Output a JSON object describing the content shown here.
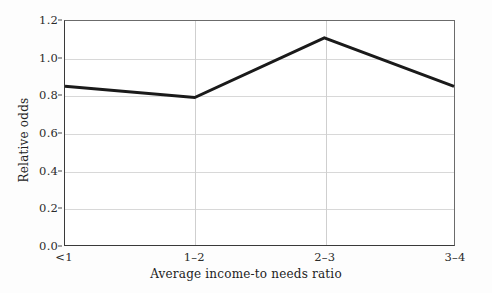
{
  "chart_data": {
    "type": "line",
    "title": "",
    "subtitle": "",
    "xlabel": "Average income-to needs ratio",
    "ylabel": "Relative odds",
    "categories": [
      "<1",
      "1–2",
      "2–3",
      "3–4"
    ],
    "values": [
      0.85,
      0.79,
      1.11,
      0.85
    ],
    "series": [
      {
        "name": "Relative odds",
        "values": [
          0.85,
          0.79,
          1.11,
          0.85
        ]
      }
    ],
    "ylim": [
      0.0,
      1.2
    ],
    "ytick_labels": [
      "0.0",
      "0.2",
      "0.4",
      "0.6",
      "0.8",
      "1.0",
      "1.2"
    ],
    "ytick_values": [
      0.0,
      0.2,
      0.4,
      0.6,
      0.8,
      1.0,
      1.2
    ],
    "xtick_labels": [
      "<1",
      "1–2",
      "2–3",
      "3–4"
    ],
    "grid": "horizontal-and-vertical",
    "legend": "none",
    "line_color": "#1a1a1a",
    "grid_color": "#d8d8d8",
    "axis_color": "#3a3a3a",
    "background_color": "#ffffff",
    "markers": "none",
    "annotations": []
  }
}
